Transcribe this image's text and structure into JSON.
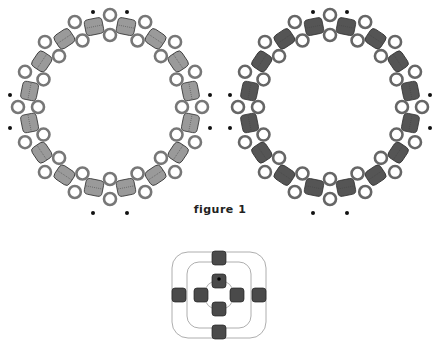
{
  "figure": {
    "caption": "figure 1",
    "panels": [
      {
        "name": "ring-light",
        "cx": 110,
        "cy": 107,
        "units": 16,
        "bead_color": "#9a9a9a",
        "ring_color": "#777777"
      },
      {
        "name": "ring-dark",
        "cx": 330,
        "cy": 107,
        "units": 16,
        "bead_color": "#555555",
        "ring_color": "#666666"
      }
    ],
    "detail": {
      "cx": 219,
      "cy": 295,
      "bead_color": "#4a4a4a",
      "thread_color": "#999999"
    },
    "marker_color": "#111111"
  }
}
